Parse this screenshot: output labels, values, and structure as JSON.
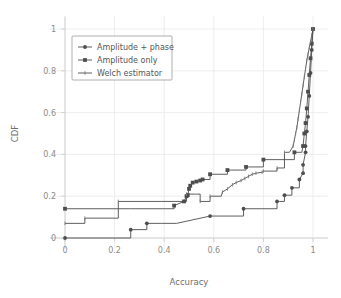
{
  "chart_data": {
    "type": "line",
    "title": "",
    "xlabel": "Accuracy",
    "ylabel": "CDF",
    "xlim": [
      -0.06,
      1.06
    ],
    "ylim": [
      -0.05,
      1.06
    ],
    "xticks": [
      "0",
      "0.2",
      "0.4",
      "0.6",
      "0.8",
      "1"
    ],
    "xtick_values": [
      0,
      0.2,
      0.4,
      0.6,
      0.8,
      1
    ],
    "yticks": [
      "0",
      "0.2",
      "0.4",
      "0.6",
      "0.8",
      "1"
    ],
    "ytick_values": [
      0,
      0.2,
      0.4,
      0.6,
      0.8,
      1
    ],
    "grid": true,
    "legend_position": "upper-left",
    "series": [
      {
        "name": "Amplitude + phase",
        "marker": "circle",
        "x": [
          0.0,
          0.265,
          0.265,
          0.27,
          0.33,
          0.33,
          0.39,
          0.39,
          0.45,
          0.45,
          0.585,
          0.585,
          0.72,
          0.72,
          0.855,
          0.855,
          0.865,
          0.885,
          0.885,
          0.915,
          0.915,
          0.945,
          0.945,
          0.96,
          0.96,
          0.97,
          0.97,
          0.975,
          0.98,
          0.985,
          0.99,
          0.995,
          1.0
        ],
        "y": [
          0.0,
          0.0,
          0.04,
          0.04,
          0.04,
          0.07,
          0.07,
          0.07,
          0.07,
          0.07,
          0.105,
          0.105,
          0.105,
          0.14,
          0.14,
          0.175,
          0.175,
          0.175,
          0.205,
          0.205,
          0.24,
          0.24,
          0.28,
          0.31,
          0.35,
          0.41,
          0.44,
          0.51,
          0.58,
          0.68,
          0.79,
          0.9,
          1.0
        ]
      },
      {
        "name": "Amplitude  only",
        "marker": "square",
        "x": [
          0.0,
          0.265,
          0.265,
          0.44,
          0.44,
          0.48,
          0.49,
          0.495,
          0.5,
          0.505,
          0.515,
          0.53,
          0.545,
          0.555,
          0.585,
          0.585,
          0.655,
          0.655,
          0.73,
          0.73,
          0.8,
          0.8,
          0.925,
          0.925,
          0.955,
          0.96,
          0.965,
          0.97,
          0.975,
          0.98,
          0.985,
          0.99,
          0.995,
          1.0
        ],
        "y": [
          0.14,
          0.14,
          0.14,
          0.14,
          0.155,
          0.175,
          0.2,
          0.205,
          0.235,
          0.25,
          0.265,
          0.27,
          0.275,
          0.28,
          0.28,
          0.305,
          0.305,
          0.325,
          0.325,
          0.34,
          0.34,
          0.375,
          0.375,
          0.41,
          0.41,
          0.44,
          0.5,
          0.55,
          0.62,
          0.7,
          0.78,
          0.86,
          0.93,
          1.0
        ]
      },
      {
        "name": "Welch estimator",
        "marker": "tick",
        "x": [
          0.0,
          0.08,
          0.08,
          0.215,
          0.215,
          0.39,
          0.39,
          0.44,
          0.44,
          0.49,
          0.49,
          0.525,
          0.545,
          0.545,
          0.585,
          0.585,
          0.63,
          0.635,
          0.655,
          0.675,
          0.69,
          0.71,
          0.725,
          0.74,
          0.755,
          0.77,
          0.795,
          0.8,
          0.855,
          0.855,
          0.885,
          0.885,
          0.905,
          0.92,
          0.925,
          0.93,
          0.935,
          0.94,
          0.945,
          0.95,
          0.955,
          0.96,
          0.965,
          0.97,
          0.975,
          0.98,
          0.985,
          0.99,
          0.995,
          1.0
        ],
        "y": [
          0.07,
          0.07,
          0.095,
          0.095,
          0.175,
          0.175,
          0.175,
          0.175,
          0.175,
          0.175,
          0.21,
          0.21,
          0.21,
          0.175,
          0.175,
          0.2,
          0.2,
          0.22,
          0.235,
          0.255,
          0.265,
          0.275,
          0.285,
          0.295,
          0.305,
          0.31,
          0.315,
          0.32,
          0.32,
          0.335,
          0.335,
          0.41,
          0.41,
          0.44,
          0.47,
          0.5,
          0.53,
          0.57,
          0.61,
          0.65,
          0.69,
          0.73,
          0.77,
          0.81,
          0.85,
          0.88,
          0.91,
          0.94,
          0.97,
          1.0
        ]
      }
    ]
  },
  "legend": {
    "entries": [
      {
        "label": "Amplitude + phase",
        "marker": "circle"
      },
      {
        "label": "Amplitude  only",
        "marker": "square"
      },
      {
        "label": "Welch estimator",
        "marker": "tick"
      }
    ]
  },
  "colors": {
    "line": "#4d4d4d",
    "grid": "#e8e8e8",
    "axis": "#cfcfcf",
    "text": "#8a8a8a",
    "background": "#ffffff"
  }
}
